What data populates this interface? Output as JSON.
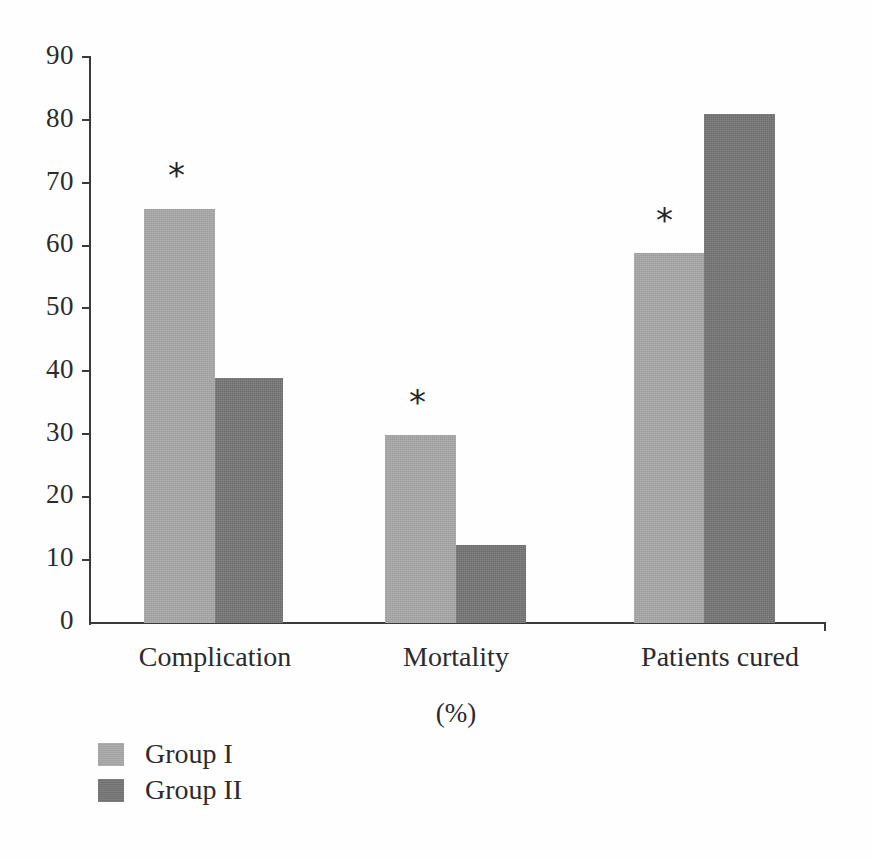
{
  "chart_data": {
    "type": "bar",
    "title": "",
    "subtitle": "",
    "xlabel": "(%)",
    "ylabel": "",
    "ylim": [
      0,
      90
    ],
    "ytick_step": 10,
    "ytick_labels": [
      "90",
      "80",
      "70",
      "60",
      "50",
      "40",
      "30",
      "20",
      "10",
      "0"
    ],
    "ytick_values": [
      90,
      80,
      70,
      60,
      50,
      40,
      30,
      20,
      10,
      0
    ],
    "grid": false,
    "legend_position": "bottom-left",
    "categories": [
      "Complication",
      "Mortality",
      "Patients cured"
    ],
    "series": [
      {
        "name": "Group I",
        "color": "#a9a9a9",
        "values": [
          66,
          30,
          59
        ]
      },
      {
        "name": "Group II",
        "color": "#777777",
        "values": [
          39,
          12.5,
          81
        ]
      }
    ],
    "annotations": [
      {
        "text": "*",
        "category": "Complication",
        "series": "Group I",
        "value": 66
      },
      {
        "text": "*",
        "category": "Mortality",
        "series": "Group I",
        "value": 30
      },
      {
        "text": "*",
        "category": "Patients cured",
        "series": "Group I",
        "value": 59
      }
    ]
  },
  "axis": {
    "unit_label": "(%)",
    "tick_labels": [
      "90",
      "80",
      "70",
      "60",
      "50",
      "40",
      "30",
      "20",
      "10",
      "0"
    ]
  },
  "categories": {
    "c0": "Complication",
    "c1": "Mortality",
    "c2": "Patients cured"
  },
  "legend": {
    "items": [
      {
        "label": "Group I",
        "color": "#a9a9a9"
      },
      {
        "label": "Group II",
        "color": "#777777"
      }
    ]
  },
  "markers": {
    "star": "*"
  }
}
